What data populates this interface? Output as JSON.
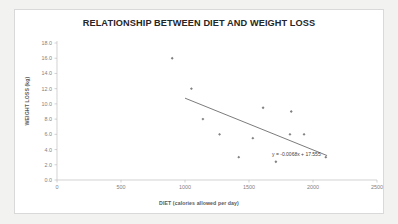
{
  "chart_data": {
    "type": "scatter",
    "title": "RELATIONSHIP BETWEEN DIET AND WEIGHT LOSS",
    "xlabel": "DIET (calories allowed per day)",
    "ylabel": "WEIGHT  LOSS (kg)",
    "xlim": [
      0,
      2500
    ],
    "ylim": [
      0,
      18
    ],
    "xticks": [
      0,
      500,
      1000,
      1500,
      2000,
      2500
    ],
    "xtick_labels": [
      "0",
      "500",
      "1000",
      "1500",
      "2000",
      "2500"
    ],
    "yticks": [
      0,
      2,
      4,
      6,
      8,
      10,
      12,
      14,
      16,
      18
    ],
    "ytick_labels": [
      "0.0",
      "2.0",
      "4.0",
      "6.0",
      "8.0",
      "10.0",
      "12.0",
      "14.0",
      "16.0",
      "18.0"
    ],
    "grid": false,
    "legend": false,
    "marker_color": "#808080",
    "marker_shape": "diamond",
    "axis_color": "#bfbfbf",
    "points": [
      {
        "x": 900,
        "y": 16.0
      },
      {
        "x": 1050,
        "y": 12.0
      },
      {
        "x": 1140,
        "y": 8.0
      },
      {
        "x": 1270,
        "y": 6.0
      },
      {
        "x": 1420,
        "y": 3.0
      },
      {
        "x": 1530,
        "y": 5.5
      },
      {
        "x": 1610,
        "y": 9.5
      },
      {
        "x": 1710,
        "y": 2.4
      },
      {
        "x": 1820,
        "y": 6.0
      },
      {
        "x": 1830,
        "y": 9.0
      },
      {
        "x": 1930,
        "y": 6.0
      },
      {
        "x": 2100,
        "y": 3.0
      }
    ],
    "trendline": {
      "equation_label": "y = -0.0068x + 17.555",
      "slope": -0.0068,
      "intercept": 17.555,
      "x_start": 1000,
      "x_end": 2110,
      "color": "#595959"
    }
  }
}
